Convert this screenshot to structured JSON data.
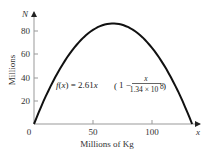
{
  "chart_data": {
    "type": "line",
    "title": "",
    "xlabel": "Millions of Kg",
    "ylabel": "Millions",
    "x_axis_var": "x",
    "y_axis_var": "N",
    "xlim": [
      0,
      140
    ],
    "ylim": [
      0,
      95
    ],
    "x_ticks": [
      0,
      50,
      100
    ],
    "y_ticks": [
      20,
      40,
      60,
      80
    ],
    "grid": false,
    "legend": null,
    "annotation": {
      "lhs": "f(x) = 2.61x",
      "open_paren": "(",
      "one_minus": "1 −",
      "numerator": "x",
      "denominator": "1.34 × 10",
      "exponent": "8",
      "close_paren": ")"
    },
    "series": [
      {
        "name": "f(x) = 2.61x(1 - x/1.34e8)",
        "x": [
          0,
          10,
          20,
          30,
          40,
          50,
          60,
          67,
          70,
          80,
          90,
          100,
          110,
          120,
          130,
          134
        ],
        "y": [
          0,
          24.1,
          44.4,
          60.8,
          73.2,
          81.8,
          86.5,
          87.4,
          87.3,
          84.2,
          77.3,
          66.3,
          52.1,
          35.2,
          10.1,
          0
        ]
      }
    ]
  }
}
